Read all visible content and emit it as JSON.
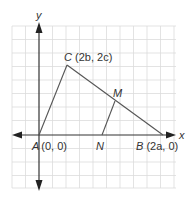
{
  "diagram": {
    "type": "coordinate-plane-triangle",
    "axes": {
      "x_label": "x",
      "y_label": "y"
    },
    "points": {
      "A": {
        "name": "A",
        "coords": "(0, 0)"
      },
      "B": {
        "name": "B",
        "coords": "(2a, 0)"
      },
      "C": {
        "name": "C",
        "coords": "(2b, 2c)"
      },
      "M": {
        "name": "M",
        "coords": ""
      },
      "N": {
        "name": "N",
        "coords": ""
      }
    },
    "segments": [
      "AC",
      "CB",
      "AB",
      "MN"
    ],
    "colors": {
      "grid": "#d9d9d9",
      "lines": "#555555",
      "axes": "#333333",
      "text": "#333333"
    }
  }
}
